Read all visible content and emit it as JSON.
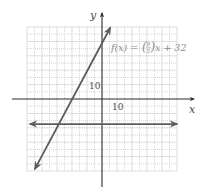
{
  "chart_data": {
    "type": "line",
    "title": "",
    "xlabel": "x",
    "ylabel": "y",
    "xlim": [
      -50,
      50
    ],
    "ylim": [
      -50,
      50
    ],
    "grid": true,
    "grid_step": 10,
    "tick_labels": {
      "x": "10",
      "y": "10"
    },
    "annotation": "f(x) = (9/5)x + 32",
    "series": [
      {
        "name": "f(x) = (9/5)x + 32",
        "kind": "line",
        "slope": 1.8,
        "intercept": 32,
        "x": [
          -44.7,
          5.5
        ],
        "y": [
          -48.5,
          49.5
        ],
        "arrows": "both"
      },
      {
        "name": "horizontal line",
        "kind": "line",
        "slope": 0,
        "intercept": -17.4,
        "x": [
          -48,
          50
        ],
        "y": [
          -17.4,
          -17.4
        ],
        "arrows": "both"
      }
    ],
    "colors": {
      "lines": "#5c5c5c",
      "axes": "#2a2a2a",
      "grid": "#b8b8b8",
      "equation": "#8a8a8a"
    }
  },
  "labels": {
    "x_axis": "x",
    "y_axis": "y",
    "x_tick": "10",
    "y_tick": "10",
    "equation_prefix": "f(x) = ",
    "equation_num": "9",
    "equation_den": "5",
    "equation_suffix": "x + 32"
  }
}
